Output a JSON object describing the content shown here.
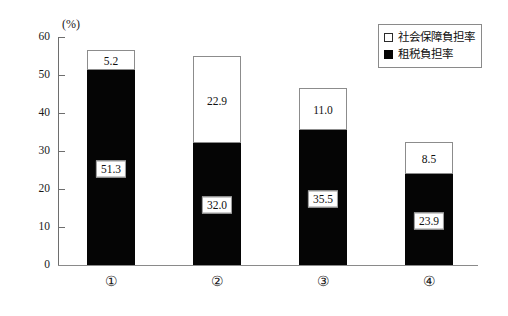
{
  "chart_data": {
    "type": "bar",
    "subtype": "stacked-bar",
    "title": "",
    "xlabel": "",
    "ylabel": "",
    "yunit": "(%)",
    "ylim": [
      0,
      60
    ],
    "yticks": [
      0,
      10,
      20,
      30,
      40,
      50,
      60
    ],
    "grid": false,
    "legend_position": "top-right",
    "categories": [
      "①",
      "②",
      "③",
      "④"
    ],
    "series": [
      {
        "name": "租税負担率",
        "swatch": "dark",
        "values": [
          51.3,
          32.0,
          35.5,
          23.9
        ],
        "labels": [
          "51.3",
          "32.0",
          "35.5",
          "23.9"
        ]
      },
      {
        "name": "社会保障負担率",
        "swatch": "light",
        "values": [
          5.2,
          22.9,
          11.0,
          8.5
        ],
        "labels": [
          "5.2",
          "22.9",
          "11.0",
          "8.5"
        ]
      }
    ],
    "totals": [
      56.5,
      54.9,
      46.5,
      32.4
    ]
  },
  "axis": {
    "unit_label": "(%)",
    "y_tick_labels": [
      "60",
      "50",
      "40",
      "30",
      "20",
      "10",
      "0"
    ],
    "x_tick_labels": [
      "①",
      "②",
      "③",
      "④"
    ]
  },
  "legend": {
    "items": [
      {
        "label": "社会保障負担率",
        "swatch": "light"
      },
      {
        "label": "租税負担率",
        "swatch": "dark"
      }
    ]
  },
  "colors": {
    "dark_series": "#050505",
    "light_series": "#ffffff",
    "axis": "#6e6e6e",
    "text": "#111111"
  }
}
